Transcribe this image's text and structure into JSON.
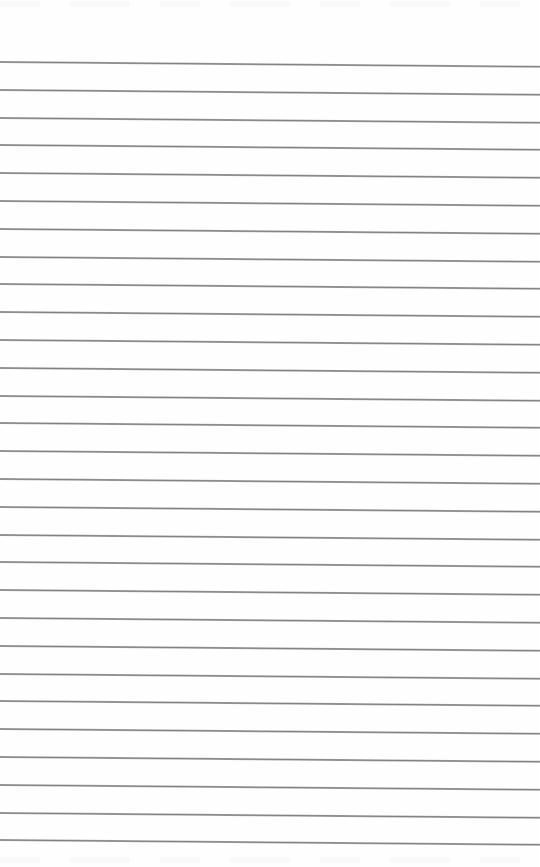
{
  "page": {
    "type": "lined-paper",
    "background_color": "#fefefe",
    "line_color": "#8a8a8a",
    "line_count": 29,
    "first_line_y": 61,
    "line_spacing": 27.8,
    "line_tilt_deg": 0.5,
    "text": ""
  }
}
